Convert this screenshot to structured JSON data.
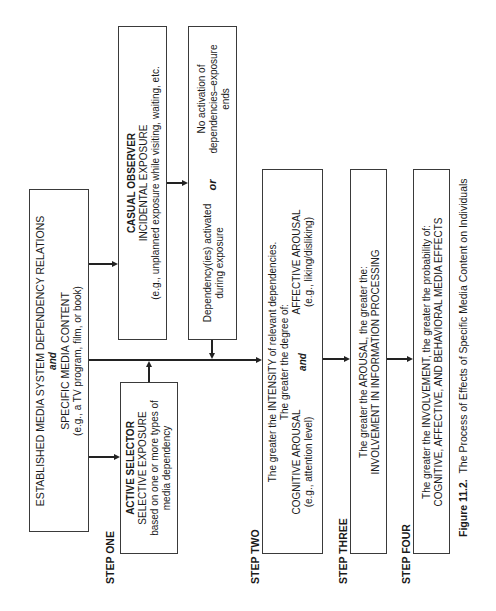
{
  "figure": {
    "caption_label": "Figure 11.2.",
    "caption_text": "The Process of Effects of Specific Media Content on Individuals"
  },
  "steps": {
    "one": "STEP ONE",
    "two": "STEP TWO",
    "three": "STEP THREE",
    "four": "STEP FOUR"
  },
  "source_box": {
    "line1": "ESTABLISHED MEDIA SYSTEM DEPENDENCY RELATIONS",
    "connector": "and",
    "line2": "SPECIFIC MEDIA CONTENT",
    "line3": "(e.g., a TV program, film, or book)"
  },
  "casual_observer": {
    "title": "CASUAL OBSERVER",
    "subtitle": "INCIDENTAL EXPOSURE",
    "example": "(e.g., unplanned exposure while visiting, waiting, etc."
  },
  "dependency_activated": {
    "line1": "Dependency(ies) activated",
    "line2": "during exposure"
  },
  "or_label": "or",
  "no_activation": {
    "line1": "No activation of",
    "line2": "dependencies–exposure",
    "line3": "ends"
  },
  "active_selector": {
    "title": "ACTIVE SELECTOR",
    "subtitle": "SELECTIVE EXPOSURE",
    "line1": "based on one or more types of",
    "line2": "media dependency"
  },
  "step_two_box": {
    "line1": "The greater the INTENSITY of relevant dependencies.",
    "line2": "The greater the degree of:",
    "left_title": "COGNITIVE AROUSAL",
    "left_example": "(e.g., attention level)",
    "connector": "and",
    "right_title": "AFFECTIVE AROUSAL",
    "right_example": "(e.g., liking/disliking)"
  },
  "step_three_box": {
    "line1": "The greater the AROUSAL, the greater the:",
    "line2": "INVOLVEMENT IN INFORMATION PROCESSING"
  },
  "step_four_box": {
    "line1": "The greater the INVOLVEMENT, the greater the probability of:",
    "line2": "COGNITIVE, AFFECTIVE, AND BEHAVIORAL MEDIA EFFECTS"
  }
}
